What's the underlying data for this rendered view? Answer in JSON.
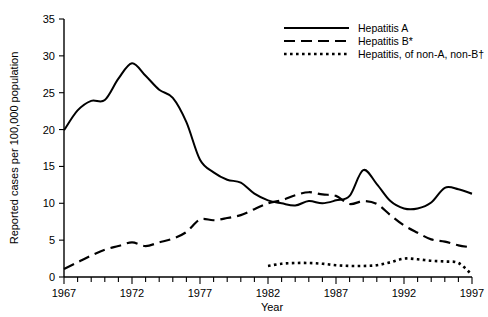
{
  "chart_data": {
    "type": "line",
    "title": "",
    "xlabel": "Year",
    "ylabel": "Reported cases per 100,000 population",
    "xlim": [
      1967,
      1997
    ],
    "ylim": [
      0,
      35
    ],
    "ytick_values": [
      0,
      5,
      10,
      15,
      20,
      25,
      30,
      35
    ],
    "ytick_labels": [
      "0",
      "5",
      "10",
      "15",
      "20",
      "25",
      "30",
      "35"
    ],
    "xtick_values": [
      1967,
      1972,
      1977,
      1982,
      1987,
      1992,
      1997
    ],
    "xtick_labels": [
      "1967",
      "1972",
      "1977",
      "1982",
      "1987",
      "1992",
      "1997"
    ],
    "xtick_minor_step": 1,
    "grid": false,
    "legend_position": "top-right",
    "x": [
      1967,
      1968,
      1969,
      1970,
      1971,
      1972,
      1973,
      1974,
      1975,
      1976,
      1977,
      1978,
      1979,
      1980,
      1981,
      1982,
      1983,
      1984,
      1985,
      1986,
      1987,
      1988,
      1989,
      1990,
      1991,
      1992,
      1993,
      1994,
      1995,
      1996,
      1997
    ],
    "series": [
      {
        "name": "Hepatitis A",
        "style": "solid",
        "x": [
          1967,
          1968,
          1969,
          1970,
          1971,
          1972,
          1973,
          1974,
          1975,
          1976,
          1977,
          1978,
          1979,
          1980,
          1981,
          1982,
          1983,
          1984,
          1985,
          1986,
          1987,
          1988,
          1989,
          1990,
          1991,
          1992,
          1993,
          1994,
          1995,
          1996,
          1997
        ],
        "values": [
          19.9,
          22.6,
          23.9,
          24.0,
          26.9,
          29.0,
          27.3,
          25.4,
          24.3,
          21.0,
          15.9,
          14.2,
          13.2,
          12.8,
          11.3,
          10.4,
          10.0,
          9.7,
          10.3,
          10.0,
          10.4,
          11.0,
          14.5,
          12.6,
          10.3,
          9.3,
          9.3,
          10.1,
          12.1,
          11.9,
          11.3
        ]
      },
      {
        "name": "Hepatitis B*",
        "style": "dashed",
        "x": [
          1967,
          1968,
          1969,
          1970,
          1971,
          1972,
          1973,
          1974,
          1975,
          1976,
          1977,
          1978,
          1979,
          1980,
          1981,
          1982,
          1983,
          1984,
          1985,
          1986,
          1987,
          1988,
          1989,
          1990,
          1991,
          1992,
          1993,
          1994,
          1995,
          1996,
          1997
        ],
        "values": [
          1.1,
          2.0,
          2.9,
          3.7,
          4.2,
          4.7,
          4.2,
          4.7,
          5.2,
          6.1,
          7.8,
          7.7,
          8.0,
          8.4,
          9.2,
          10.0,
          10.4,
          11.1,
          11.5,
          11.2,
          11.0,
          9.9,
          10.3,
          9.9,
          8.4,
          7.0,
          6.0,
          5.1,
          4.8,
          4.3,
          4.0
        ]
      },
      {
        "name": "Hepatitis, of non-A, non-B†",
        "style": "dotted",
        "x": [
          1982,
          1983,
          1984,
          1985,
          1986,
          1987,
          1988,
          1989,
          1990,
          1991,
          1992,
          1993,
          1994,
          1995,
          1996,
          1997
        ],
        "values": [
          1.5,
          1.8,
          1.9,
          1.9,
          1.8,
          1.6,
          1.5,
          1.5,
          1.6,
          2.0,
          2.5,
          2.4,
          2.2,
          2.1,
          1.9,
          0.3
        ]
      }
    ]
  },
  "legend": {
    "items": [
      {
        "label": "Hepatitis A",
        "style": "solid"
      },
      {
        "label": "Hepatitis B*",
        "style": "dashed"
      },
      {
        "label": "Hepatitis, of non-A, non-B†",
        "style": "dotted"
      }
    ]
  },
  "axes": {
    "y_title": "Reported cases per 100,000 population",
    "x_title": "Year"
  }
}
